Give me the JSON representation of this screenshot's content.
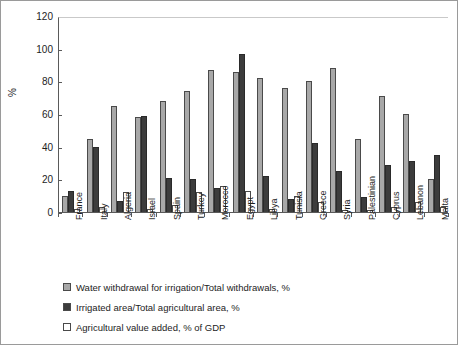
{
  "chart_data": {
    "type": "bar",
    "title": "",
    "xlabel": "",
    "ylabel": "%",
    "ylim": [
      0,
      120
    ],
    "yticks": [
      0,
      20,
      40,
      60,
      80,
      100,
      120
    ],
    "grid": false,
    "legend_position": "bottom-left",
    "categories": [
      "France",
      "Italy",
      "Algeria",
      "Israel",
      "Spain",
      "Turkey",
      "Morocco",
      "Egypt",
      "Libya",
      "Tunisia",
      "Greece",
      "Syria",
      "Palestinian",
      "Cyprus",
      "Lebanon",
      "Malta"
    ],
    "series": [
      {
        "name": "Water withdrawal for irrigation/Total withdrawals, %",
        "color": "#a8a8a8",
        "values": [
          10,
          45,
          65,
          58,
          68,
          74,
          87,
          86,
          82,
          76,
          80,
          88,
          45,
          71,
          60,
          20
        ]
      },
      {
        "name": "Irrigated area/Total agricultural area, %",
        "color": "#3c3c3c",
        "values": [
          13,
          40,
          7,
          59,
          21,
          20,
          15,
          97,
          22,
          8,
          42,
          25,
          9,
          29,
          31,
          35
        ]
      },
      {
        "name": "Agricultural value added, % of GDP",
        "color": "#ffffff",
        "values": [
          2,
          3,
          12,
          2,
          4,
          12,
          16,
          13,
          2,
          10,
          6,
          1,
          1,
          3,
          6,
          3
        ]
      }
    ]
  },
  "legend": {
    "items": [
      {
        "label": "Water withdrawal for irrigation/Total withdrawals, %",
        "swatch": "s0"
      },
      {
        "label": "Irrigated area/Total agricultural area, %",
        "swatch": "s1"
      },
      {
        "label": "Agricultural value added, % of GDP",
        "swatch": "s2"
      }
    ]
  },
  "axis": {
    "y_title": "%"
  }
}
